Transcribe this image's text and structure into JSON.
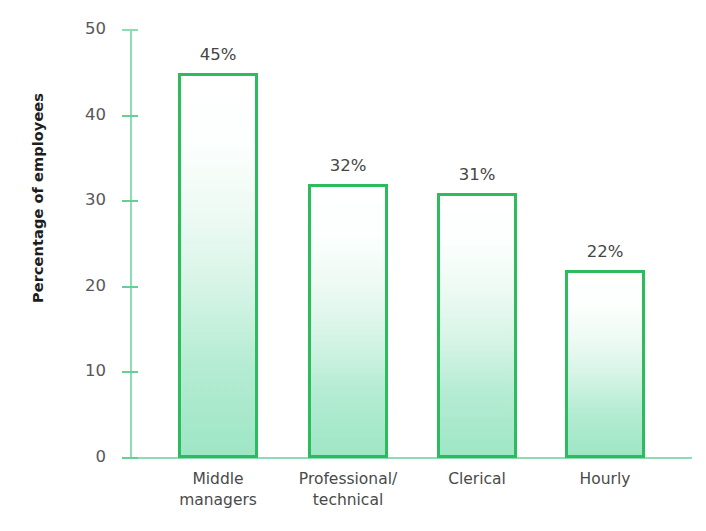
{
  "chart_data": {
    "type": "bar",
    "title": "",
    "subtitle": "",
    "xlabel": "",
    "ylabel": "Percentage of employees",
    "ylim": [
      0,
      50
    ],
    "yticks": [
      0,
      10,
      20,
      30,
      40,
      50
    ],
    "ytick_labels": [
      "0",
      "10",
      "20",
      "30",
      "40",
      "50"
    ],
    "grid": false,
    "legend": false,
    "categories": [
      "Middle managers",
      "Professional/ technical",
      "Clerical",
      "Hourly"
    ],
    "category_labels": [
      "Middle\nmanagers",
      "Professional/\ntechnical",
      "Clerical",
      "Hourly"
    ],
    "values": [
      45,
      32,
      31,
      22
    ],
    "data_labels": [
      "45%",
      "32%",
      "31%",
      "22%"
    ],
    "colors": {
      "bar_border": "#2cbc5e",
      "bar_fill_top": "#ffffff",
      "bar_fill_bottom": "#9ee6c6",
      "axis_line": "#8ddcb3",
      "tick_mark": "#66cf96",
      "tick_label": "#585858",
      "value_label": "#454545",
      "category_label": "#4a4a4a",
      "axis_title": "#1d1d1f",
      "background": "#ffffff"
    }
  },
  "axis": {
    "y_title": "Percentage of employees"
  }
}
